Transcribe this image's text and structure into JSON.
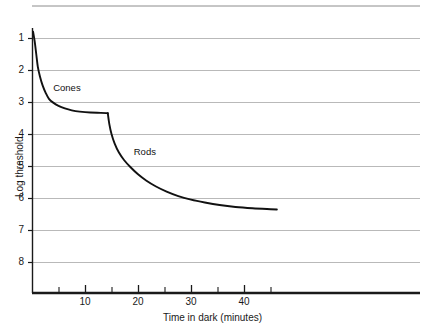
{
  "chart_data": {
    "type": "line",
    "title": "",
    "xlabel": "Time in dark (minutes)",
    "ylabel": "Log threshold",
    "xlim": [
      0,
      73
    ],
    "ylim": [
      0.5,
      8.6
    ],
    "grid": true,
    "legend": "inline-annotations",
    "xticks_major": [
      10,
      20,
      30,
      40
    ],
    "xticks_minor": [
      5,
      15,
      25,
      35,
      45
    ],
    "yticks": [
      1,
      2,
      3,
      4,
      5,
      6,
      7,
      8
    ],
    "annotations": [
      {
        "text": "Cones",
        "x": 4.0,
        "y": 6.45
      },
      {
        "text": "Rods",
        "x": 19.2,
        "y": 4.45
      }
    ],
    "series": [
      {
        "name": "Cones",
        "points": [
          [
            0.2,
            8.2
          ],
          [
            0.5,
            7.9
          ],
          [
            0.8,
            7.5
          ],
          [
            1.1,
            7.1
          ],
          [
            1.5,
            6.8
          ],
          [
            2.0,
            6.52
          ],
          [
            2.6,
            6.28
          ],
          [
            3.2,
            6.1
          ],
          [
            4.0,
            5.98
          ],
          [
            5.0,
            5.88
          ],
          [
            6.2,
            5.8
          ],
          [
            7.5,
            5.74
          ],
          [
            9.0,
            5.7
          ],
          [
            11.0,
            5.67
          ],
          [
            13.0,
            5.66
          ],
          [
            14.3,
            5.65
          ]
        ]
      },
      {
        "name": "Rods",
        "points": [
          [
            14.3,
            5.65
          ],
          [
            14.6,
            5.3
          ],
          [
            15.0,
            5.0
          ],
          [
            15.6,
            4.7
          ],
          [
            16.4,
            4.42
          ],
          [
            17.4,
            4.18
          ],
          [
            18.6,
            3.96
          ],
          [
            20.0,
            3.74
          ],
          [
            21.6,
            3.54
          ],
          [
            23.4,
            3.36
          ],
          [
            25.4,
            3.2
          ],
          [
            27.6,
            3.06
          ],
          [
            30.0,
            2.95
          ],
          [
            32.6,
            2.86
          ],
          [
            35.4,
            2.78
          ],
          [
            38.4,
            2.72
          ],
          [
            41.6,
            2.68
          ],
          [
            45.0,
            2.65
          ],
          [
            46.2,
            2.64
          ]
        ]
      }
    ],
    "tick_labels": {
      "x": [
        "10",
        "20",
        "30",
        "40"
      ],
      "y": [
        "8",
        "7",
        "6",
        "5",
        "4",
        "3",
        "2",
        "1"
      ]
    }
  },
  "style": {
    "gridline_color": "#b9b9b9",
    "axis_color": "#1a1a1a",
    "curve_color": "#111111",
    "background": "#ffffff"
  }
}
